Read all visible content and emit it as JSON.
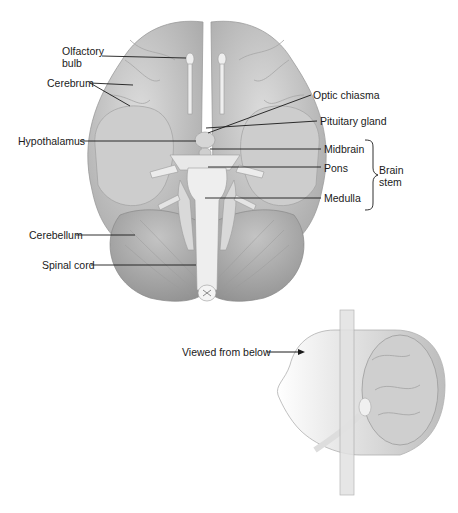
{
  "figure": {
    "labels": {
      "olfactory_bulb_1": "Olfactory",
      "olfactory_bulb_2": "bulb",
      "cerebrum": "Cerebrum",
      "hypothalamus": "Hypothalamus",
      "cerebellum": "Cerebellum",
      "spinal_cord": "Spinal cord",
      "optic_chiasma": "Optic chiasma",
      "pituitary_gland": "Pituitary gland",
      "midbrain": "Midbrain",
      "pons": "Pons",
      "medulla": "Medulla",
      "brain_stem_1": "Brain",
      "brain_stem_2": "stem",
      "viewed_from_below": "Viewed from below"
    },
    "colors": {
      "tissue": "#c9c9c9",
      "tissue_dark": "#a8a8a8",
      "stem": "#ebebeb",
      "line": "#1a1a1a"
    }
  }
}
